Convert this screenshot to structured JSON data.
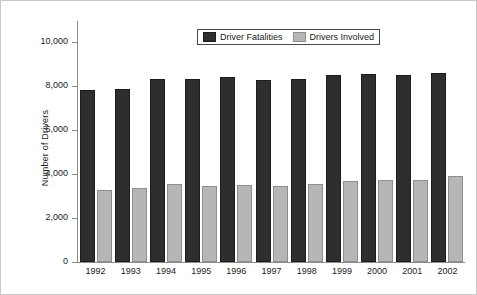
{
  "chart_data": {
    "type": "bar",
    "title": "",
    "xlabel": "",
    "ylabel": "Number of Drivers",
    "ylim": [
      0,
      11000
    ],
    "yticks": [
      0,
      2000,
      4000,
      6000,
      8000,
      10000
    ],
    "ytick_labels": [
      "0",
      "2,000",
      "4,000",
      "6,000",
      "8,000",
      "10,000"
    ],
    "grid": false,
    "legend_position": "upper center",
    "categories": [
      "1992",
      "1993",
      "1994",
      "1995",
      "1996",
      "1997",
      "1998",
      "1999",
      "2000",
      "2001",
      "2002"
    ],
    "series": [
      {
        "name": "Driver Fatalities",
        "color": "#2e2e2e",
        "values": [
          7750,
          7820,
          8240,
          8240,
          8340,
          8210,
          8270,
          8460,
          8480,
          8440,
          8530
        ]
      },
      {
        "name": "Drivers Involved",
        "color": "#b6b6b6",
        "values": [
          3190,
          3280,
          3490,
          3390,
          3420,
          3390,
          3460,
          3590,
          3660,
          3640,
          3850
        ]
      }
    ]
  },
  "legend": {
    "entries": [
      {
        "label": "Driver Fatalities",
        "icon": "legend-swatch-dark"
      },
      {
        "label": "Drivers Involved",
        "icon": "legend-swatch-gray"
      }
    ]
  }
}
